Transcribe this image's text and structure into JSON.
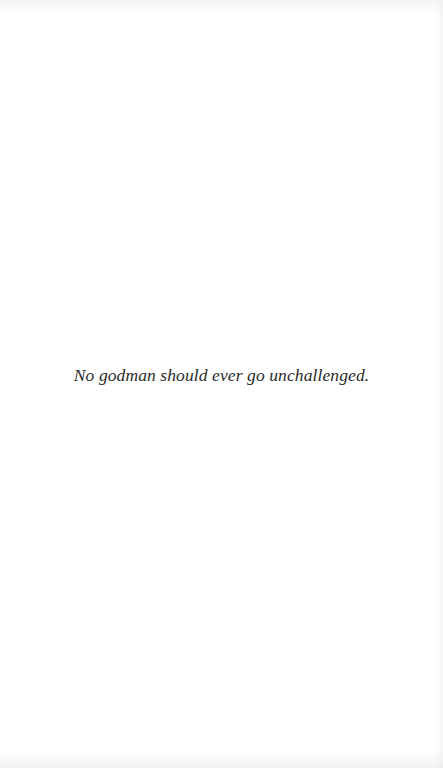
{
  "page": {
    "epigraph": "No godman should ever go unchallenged."
  },
  "colors": {
    "background": "#ffffff",
    "text": "#2a2a2a"
  }
}
